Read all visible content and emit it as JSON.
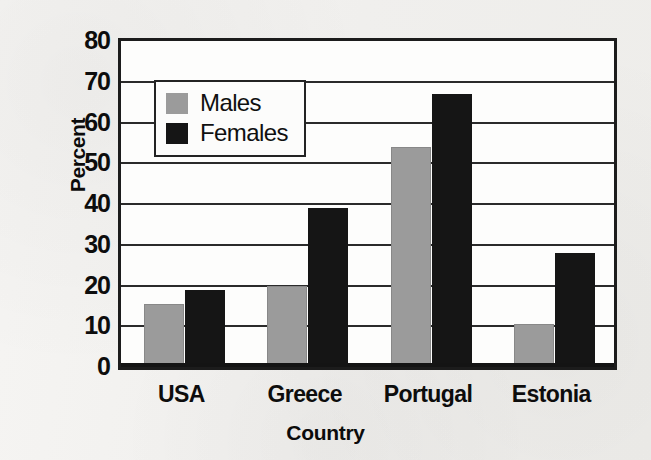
{
  "chart_data": {
    "type": "bar",
    "title": "",
    "subtitle": "",
    "xlabel": "Country",
    "ylabel": "Percent",
    "categories": [
      "USA",
      "Greece",
      "Portugal",
      "Estonia"
    ],
    "series": [
      {
        "name": "Males",
        "color": "#9b9b9b",
        "values": [
          15.5,
          20,
          54,
          10.5
        ]
      },
      {
        "name": "Females",
        "color": "#151515",
        "values": [
          19,
          39,
          67,
          28
        ]
      }
    ],
    "ylim": [
      0,
      80
    ],
    "ytick_step": 10,
    "yticks": [
      80,
      70,
      60,
      50,
      40,
      30,
      20,
      10,
      0
    ],
    "ytick_labels": [
      "80",
      "70",
      "60",
      "50",
      "40",
      "30",
      "20",
      "10",
      "0"
    ],
    "grid": "horizontal",
    "legend_position": "top-left-inside",
    "grouped": true,
    "orientation": "vertical"
  },
  "legend": {
    "entries": [
      {
        "label": "Males",
        "swatch": "males-swatch"
      },
      {
        "label": "Females",
        "swatch": "females-swatch"
      }
    ]
  },
  "colors": {
    "males": "#9b9b9b",
    "females": "#151515",
    "axis": "#1c1c1c",
    "gridline": "#2b2b2b",
    "plot_background": "#fdfdfc",
    "page_background": "#f2f1ef",
    "text": "#0d0d0d"
  }
}
